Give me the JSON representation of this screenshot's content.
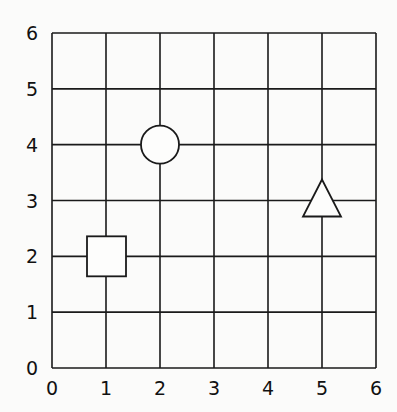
{
  "chart_data": {
    "type": "scatter",
    "title": "",
    "xlabel": "",
    "ylabel": "",
    "xlim": [
      0,
      6
    ],
    "ylim": [
      0,
      6
    ],
    "grid": true,
    "x_ticks": [
      "0",
      "1",
      "2",
      "3",
      "4",
      "5",
      "6"
    ],
    "y_ticks": [
      "0",
      "1",
      "2",
      "3",
      "4",
      "5",
      "6"
    ],
    "points": [
      {
        "shape": "square",
        "x": 1,
        "y": 2
      },
      {
        "shape": "circle",
        "x": 2,
        "y": 4
      },
      {
        "shape": "triangle",
        "x": 5,
        "y": 3
      }
    ]
  }
}
